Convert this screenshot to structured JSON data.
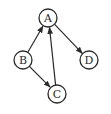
{
  "diagram": {
    "type": "directed-graph",
    "nodes": [
      {
        "id": "A",
        "label": "A",
        "x": 48,
        "y": 18
      },
      {
        "id": "B",
        "label": "B",
        "x": 23,
        "y": 60
      },
      {
        "id": "C",
        "label": "C",
        "x": 57,
        "y": 94
      },
      {
        "id": "D",
        "label": "D",
        "x": 89,
        "y": 60
      }
    ],
    "edges": [
      {
        "from": "B",
        "to": "A"
      },
      {
        "from": "B",
        "to": "C"
      },
      {
        "from": "C",
        "to": "A"
      },
      {
        "from": "A",
        "to": "D"
      }
    ],
    "node_radius": 9,
    "stroke_color": "#2a2a2a",
    "background": "#ffffff"
  }
}
